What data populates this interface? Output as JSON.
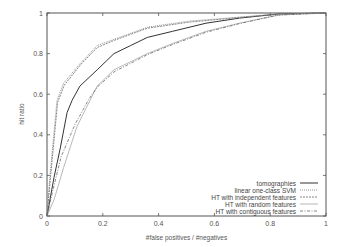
{
  "chart_data": {
    "type": "line",
    "title": "",
    "xlabel": "#false positives / #negatives",
    "ylabel": "hit ratio",
    "xlim": [
      0,
      1
    ],
    "ylim": [
      0,
      1
    ],
    "xticks": [
      "0",
      "0.2",
      "0.4",
      "0.6",
      "0.8",
      "1"
    ],
    "yticks": [
      "0",
      "0.2",
      "0.4",
      "0.6",
      "0.8",
      "1"
    ],
    "grid": false,
    "legend_position": "lower right",
    "series": [
      {
        "name": "tomographies",
        "style": "solid",
        "color": "#333333",
        "x": [
          0,
          0.025,
          0.047,
          0.072,
          0.09,
          0.118,
          0.18,
          0.24,
          0.3,
          0.36,
          0.45,
          0.57,
          0.69,
          0.83,
          1.0
        ],
        "y": [
          0,
          0.19,
          0.33,
          0.51,
          0.57,
          0.64,
          0.72,
          0.8,
          0.84,
          0.88,
          0.91,
          0.95,
          0.975,
          0.995,
          1.0
        ]
      },
      {
        "name": "linear one-class SVM",
        "style": "dotted",
        "color": "#888888",
        "x": [
          0,
          0.01,
          0.036,
          0.06,
          0.118,
          0.18,
          0.24,
          0.36,
          0.51,
          0.69,
          0.83,
          1.0
        ],
        "y": [
          0,
          0.19,
          0.57,
          0.655,
          0.75,
          0.84,
          0.87,
          0.93,
          0.96,
          0.98,
          0.995,
          1.0
        ]
      },
      {
        "name": "HT with independent features",
        "style": "short-dash",
        "color": "#777777",
        "x": [
          0,
          0.012,
          0.038,
          0.062,
          0.12,
          0.18,
          0.24,
          0.36,
          0.51,
          0.69,
          0.83,
          1.0
        ],
        "y": [
          0,
          0.18,
          0.56,
          0.645,
          0.745,
          0.83,
          0.865,
          0.925,
          0.955,
          0.978,
          0.995,
          1.0
        ]
      },
      {
        "name": "HT with random features",
        "style": "solid-thin",
        "color": "#999999",
        "x": [
          0,
          0.025,
          0.06,
          0.107,
          0.154,
          0.18,
          0.24,
          0.36,
          0.45,
          0.57,
          0.69,
          0.83,
          1.0
        ],
        "y": [
          0,
          0.08,
          0.24,
          0.44,
          0.57,
          0.64,
          0.72,
          0.8,
          0.85,
          0.91,
          0.95,
          0.99,
          1.0
        ]
      },
      {
        "name": "HT with contiguous features",
        "style": "dash-dot",
        "color": "#666666",
        "x": [
          0,
          0.02,
          0.05,
          0.1,
          0.15,
          0.18,
          0.24,
          0.36,
          0.45,
          0.57,
          0.69,
          0.83,
          1.0
        ],
        "y": [
          0,
          0.12,
          0.29,
          0.45,
          0.575,
          0.635,
          0.71,
          0.795,
          0.845,
          0.905,
          0.948,
          0.99,
          1.0
        ]
      }
    ]
  }
}
